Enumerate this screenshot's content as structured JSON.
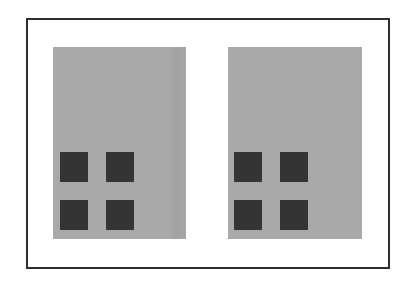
{
  "diagram": {
    "type": "two-panel comparison",
    "frame": {
      "border_color": "#2e2e2e",
      "background": "#ffffff"
    },
    "panels": [
      {
        "id": "left",
        "fill": "#a9a9a9",
        "squares": [
          {
            "row": 1,
            "col": 1,
            "color": "#343434"
          },
          {
            "row": 1,
            "col": 2,
            "color": "#343434"
          },
          {
            "row": 2,
            "col": 1,
            "color": "#343434"
          },
          {
            "row": 2,
            "col": 2,
            "color": "#343434"
          }
        ],
        "caption": ""
      },
      {
        "id": "right",
        "fill": "#a9a9a9",
        "squares": [
          {
            "row": 1,
            "col": 1,
            "color": "#343434"
          },
          {
            "row": 1,
            "col": 2,
            "color": "#343434"
          },
          {
            "row": 2,
            "col": 1,
            "color": "#343434"
          },
          {
            "row": 2,
            "col": 2,
            "color": "#343434"
          }
        ],
        "caption": ""
      }
    ]
  }
}
